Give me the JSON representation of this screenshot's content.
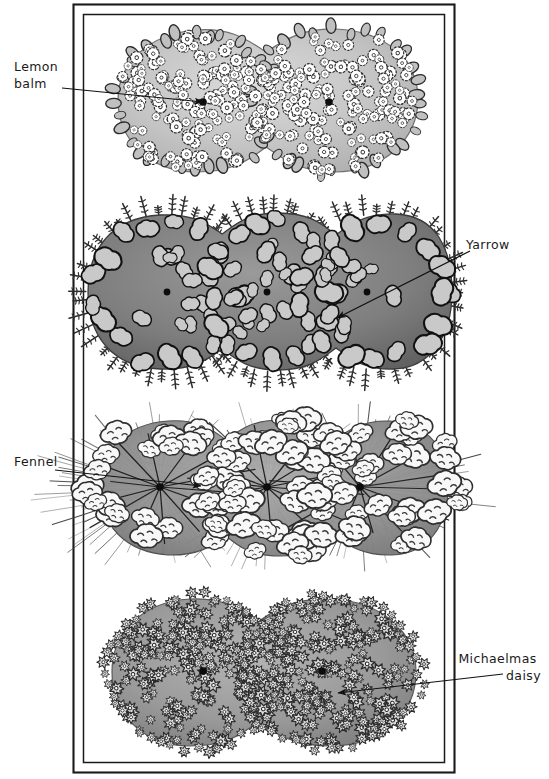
{
  "figure": {
    "kind": "hand-drawn garden planting plan",
    "border": {
      "style": "double-rule rectangle",
      "color": "#1a1a1a"
    },
    "background": "#ffffff"
  },
  "labels": [
    {
      "id": "lemon-balm",
      "text_lines": [
        "Lemon",
        "balm"
      ],
      "align": "left",
      "x": 14,
      "y": 71,
      "line_height": 17
    },
    {
      "id": "yarrow",
      "text_lines": [
        "Yarrow"
      ],
      "align": "left",
      "x": 466,
      "y": 249,
      "line_height": 17
    },
    {
      "id": "fennel",
      "text_lines": [
        "Fennel"
      ],
      "align": "left",
      "x": 14,
      "y": 466,
      "line_height": 17
    },
    {
      "id": "michaelmas-daisy",
      "text_lines": [
        "Michaelmas",
        "daisy"
      ],
      "align": "right",
      "x": 541,
      "y": 663,
      "line_height": 17
    }
  ],
  "leaders": [
    {
      "id": "leader-lemon-balm",
      "from": [
        62,
        88
      ],
      "to": [
        203,
        102
      ],
      "arrow_at": "to"
    },
    {
      "id": "leader-yarrow",
      "from": [
        470,
        251
      ],
      "to": [
        337,
        318
      ],
      "arrow_at": "to"
    },
    {
      "id": "leader-fennel",
      "from": [
        55,
        470
      ],
      "to": [
        201,
        486
      ],
      "arrow_at": "to"
    },
    {
      "id": "leader-michaelmas-daisy",
      "from": [
        503,
        674
      ],
      "to": [
        338,
        693
      ],
      "arrow_at": "to"
    }
  ],
  "plant_bands": [
    {
      "id": "lemon-balm",
      "common_name": "Lemon balm",
      "order": 1,
      "lobes": 2,
      "planting_dots": [
        [
          203,
          102
        ],
        [
          329,
          102
        ]
      ],
      "body_color": "#c6c6c6",
      "floret_color": "#ffffff",
      "outline_color": "#2a2a2a",
      "texture": "small white dotted florets with lobed leaves at margin"
    },
    {
      "id": "yarrow",
      "common_name": "Yarrow",
      "order": 2,
      "lobes": 3,
      "planting_dots": [
        [
          167,
          292
        ],
        [
          267,
          292
        ],
        [
          367,
          292
        ]
      ],
      "body_color": "#868686",
      "floret_color": "#c9c9c9",
      "outline_color": "#141414",
      "texture": "large pale flat-topped flower heads, feathery fronds at margin"
    },
    {
      "id": "fennel",
      "common_name": "Fennel",
      "order": 3,
      "lobes": 3,
      "planting_dots": [
        [
          160,
          487
        ],
        [
          267,
          487
        ],
        [
          360,
          487
        ]
      ],
      "body_color": "#9a9a9a",
      "floret_color": "#f7f7f7",
      "outline_color": "#2a2a2a",
      "texture": "fine feathery needles radiating from crowns, white cloud umbels"
    },
    {
      "id": "michaelmas-daisy",
      "common_name": "Michaelmas daisy",
      "order": 4,
      "lobes": 2,
      "planting_dots": [
        [
          203,
          671
        ],
        [
          322,
          671
        ]
      ],
      "body_color": "#a2a2a2",
      "floret_color": "#d8d8d8",
      "outline_color": "#2a2a2a",
      "texture": "dense small star-shaped daisy florets with dark centres"
    }
  ]
}
